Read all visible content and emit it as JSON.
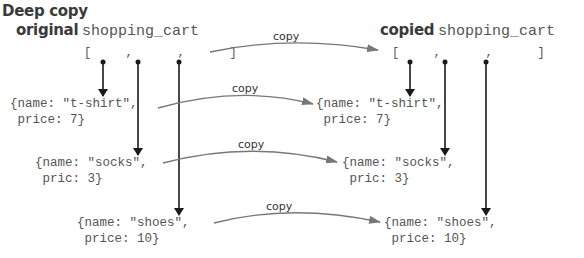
{
  "title": "Deep copy",
  "original": {
    "label_bold": "original",
    "label_code": "shopping_cart",
    "array_text": "[   ,    ,    ]"
  },
  "copied": {
    "label_bold": "copied",
    "label_code": "shopping_cart",
    "array_text": "[   ,    ,    ]"
  },
  "arrow_label": "copy",
  "original_items": [
    {
      "line1": "{name: \"t-shirt\",",
      "line2": " price: 7}"
    },
    {
      "line1": "{name: \"socks\",",
      "line2": " pric: 3}"
    },
    {
      "line1": "{name: \"shoes\",",
      "line2": " price: 10}"
    }
  ],
  "copied_items": [
    {
      "line1": "{name: \"t-shirt\",",
      "line2": " price: 7}"
    },
    {
      "line1": "{name: \"socks\",",
      "line2": " pric: 3}"
    },
    {
      "line1": "{name: \"shoes\",",
      "line2": " price: 10}"
    }
  ],
  "colors": {
    "pointer": "#1a1a1a",
    "copy_arrow": "#777777",
    "code_text": "#555555"
  }
}
